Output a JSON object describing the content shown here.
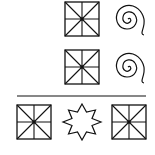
{
  "diagram": {
    "type": "figure-sequence-puzzle",
    "background": "#ffffff",
    "stroke_color": "#111111",
    "rows": [
      {
        "row": 1,
        "figures": [
          "square-with-diagonals-and-cross",
          "spiral"
        ]
      },
      {
        "row": 2,
        "figures": [
          "square-with-diagonals-and-cross",
          "spiral"
        ]
      },
      {
        "row": 3,
        "figures": [
          "square-with-diagonals-and-cross",
          "eight-point-star",
          "square-with-diagonals-and-cross"
        ]
      }
    ],
    "divider": "horizontal-line-between-row-2-and-row-3"
  }
}
